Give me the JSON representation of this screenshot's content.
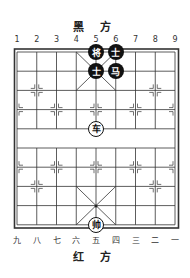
{
  "top_side": {
    "label": "黑 方"
  },
  "bottom_side": {
    "label": "红 方"
  },
  "top_files": [
    "1",
    "2",
    "3",
    "4",
    "5",
    "6",
    "7",
    "8",
    "9"
  ],
  "bottom_files": [
    "九",
    "八",
    "七",
    "六",
    "五",
    "四",
    "三",
    "二",
    "一"
  ],
  "pieces": [
    {
      "id": "black-general",
      "glyph": "将",
      "side": "black",
      "file": 5,
      "rank": 0
    },
    {
      "id": "black-advisor-1",
      "glyph": "士",
      "side": "black",
      "file": 6,
      "rank": 0
    },
    {
      "id": "black-advisor-2",
      "glyph": "士",
      "side": "black",
      "file": 5,
      "rank": 1
    },
    {
      "id": "black-horse",
      "glyph": "马",
      "side": "black",
      "file": 6,
      "rank": 1
    },
    {
      "id": "red-chariot",
      "glyph": "车",
      "side": "red",
      "file": 5,
      "rank": 4
    },
    {
      "id": "red-general",
      "glyph": "帅",
      "side": "red",
      "file": 5,
      "rank": 9
    }
  ],
  "colors": {
    "line": "#333333",
    "black_piece": "#111111",
    "red_piece_bg": "#ffffff"
  }
}
